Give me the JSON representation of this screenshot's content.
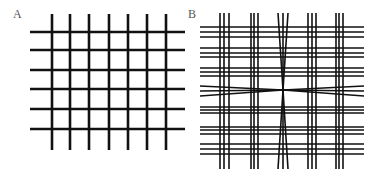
{
  "panels": [
    {
      "label": "A",
      "label_pos": [
        13,
        8
      ],
      "description": "regular grid of straight lines",
      "stroke_width": 2.6,
      "vertical_lines": [
        {
          "x": 52,
          "y1": 14,
          "y2": 150
        },
        {
          "x": 70,
          "y1": 14,
          "y2": 150
        },
        {
          "x": 89,
          "y1": 14,
          "y2": 150
        },
        {
          "x": 109,
          "y1": 14,
          "y2": 150
        },
        {
          "x": 128,
          "y1": 14,
          "y2": 150
        },
        {
          "x": 147,
          "y1": 14,
          "y2": 150
        },
        {
          "x": 166,
          "y1": 14,
          "y2": 150
        }
      ],
      "horizontal_lines": [
        {
          "y": 32,
          "x1": 30,
          "x2": 185
        },
        {
          "y": 50,
          "x1": 30,
          "x2": 185
        },
        {
          "y": 70,
          "x1": 30,
          "x2": 185
        },
        {
          "y": 89,
          "x1": 30,
          "x2": 185
        },
        {
          "y": 109,
          "x1": 30,
          "x2": 185
        },
        {
          "y": 129,
          "x1": 30,
          "x2": 185
        }
      ]
    },
    {
      "label": "B",
      "label_pos": [
        188,
        8
      ],
      "description": "grid of line triplets; middle row and column converge at center",
      "stroke_width": 1.6,
      "vertical_groups": [
        {
          "xs": [
            220,
            224,
            229
          ],
          "y1": 13,
          "y2": 169
        },
        {
          "xs": [
            251,
            254,
            258
          ],
          "y1": 13,
          "y2": 169
        },
        {
          "xs": [
            278,
            283,
            288
          ],
          "y1": 13,
          "y2": 169,
          "converge_at": [
            283,
            90
          ]
        },
        {
          "xs": [
            308,
            312,
            316
          ],
          "y1": 13,
          "y2": 169
        },
        {
          "xs": [
            336,
            339,
            343
          ],
          "y1": 13,
          "y2": 169
        }
      ],
      "horizontal_groups": [
        {
          "ys": [
            27,
            32,
            37
          ],
          "x1": 200,
          "x2": 364
        },
        {
          "ys": [
            48,
            53,
            57
          ],
          "x1": 200,
          "x2": 364
        },
        {
          "ys": [
            68,
            72,
            76
          ],
          "x1": 200,
          "x2": 364
        },
        {
          "ys": [
            86,
            91,
            96
          ],
          "x1": 200,
          "x2": 364,
          "converge_at": [
            283,
            90
          ]
        },
        {
          "ys": [
            107,
            110,
            113
          ],
          "x1": 200,
          "x2": 364
        },
        {
          "ys": [
            127,
            130,
            134
          ],
          "x1": 200,
          "x2": 364
        },
        {
          "ys": [
            144,
            149,
            154
          ],
          "x1": 200,
          "x2": 364
        }
      ]
    }
  ],
  "colors": {
    "line": "#111111",
    "label": "#555555",
    "background": "#ffffff"
  }
}
